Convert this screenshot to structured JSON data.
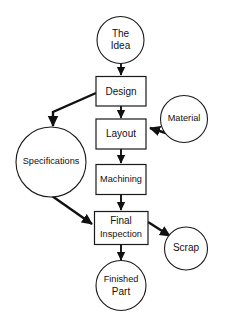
{
  "diagram": {
    "background_color": "#ffffff",
    "line_color": "#111111",
    "shape_fill": "#ffffff",
    "nodes": [
      {
        "id": "idea",
        "label_line1": "The",
        "label_line2": "Idea",
        "shape": "circle"
      },
      {
        "id": "design",
        "label_line1": "Design",
        "label_line2": "",
        "shape": "rect"
      },
      {
        "id": "specifications",
        "label_line1": "Specifications",
        "label_line2": "",
        "shape": "circle"
      },
      {
        "id": "layout",
        "label_line1": "Layout",
        "label_line2": "",
        "shape": "rect"
      },
      {
        "id": "material",
        "label_line1": "Material",
        "label_line2": "",
        "shape": "circle"
      },
      {
        "id": "machining",
        "label_line1": "Machining",
        "label_line2": "",
        "shape": "rect"
      },
      {
        "id": "final_inspection",
        "label_line1": "Final",
        "label_line2": "Inspection",
        "shape": "rect"
      },
      {
        "id": "scrap",
        "label_line1": "Scrap",
        "label_line2": "",
        "shape": "circle"
      },
      {
        "id": "finished_part",
        "label_line1": "Finished",
        "label_line2": "Part",
        "shape": "circle"
      }
    ],
    "edges": [
      {
        "id": "idea-to-design",
        "from": "idea",
        "to": "design"
      },
      {
        "id": "design-to-specifications",
        "from": "design",
        "to": "specifications"
      },
      {
        "id": "design-to-layout",
        "from": "design",
        "to": "layout"
      },
      {
        "id": "material-to-layout",
        "from": "material",
        "to": "layout"
      },
      {
        "id": "layout-to-machining",
        "from": "layout",
        "to": "machining"
      },
      {
        "id": "machining-to-final",
        "from": "machining",
        "to": "final_inspection"
      },
      {
        "id": "specifications-to-final",
        "from": "specifications",
        "to": "final_inspection"
      },
      {
        "id": "final-to-scrap",
        "from": "final_inspection",
        "to": "scrap"
      },
      {
        "id": "final-to-finished-part",
        "from": "final_inspection",
        "to": "finished_part"
      }
    ],
    "caption": ""
  }
}
